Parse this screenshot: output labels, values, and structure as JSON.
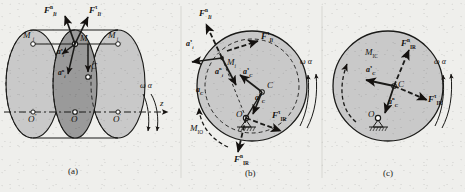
{
  "figure": {
    "caption_a": "(a)",
    "caption_b": "(b)",
    "caption_c": "(c)",
    "colors": {
      "light_gray": "#c9c9c9",
      "dark_gray": "#9a9a9a",
      "stroke": "#1a1a18",
      "page": "#efefec"
    }
  },
  "panel_a": {
    "points": {
      "m_i_double_prime": "M",
      "m_i_double_prime_sub": "i",
      "m_i_double_prime_sup": "″",
      "m_i": "M",
      "m_i_sub": "i",
      "m_i_prime": "M",
      "m_i_prime_sub": "i",
      "m_i_prime_sup": "′",
      "o_double_prime": "O",
      "o_double_prime_sup": "″",
      "o": "O",
      "o_prime": "O",
      "o_prime_sup": "′",
      "c": "C"
    },
    "vectors": {
      "f_in_base": "F",
      "f_in_sub": "Ii",
      "f_in_sup": "n",
      "f_it_base": "F",
      "f_it_sub": "Ii",
      "f_it_sup": "τ",
      "a_it_base": "a",
      "a_it_sub": "i",
      "a_it_sup": "τ",
      "a_in_base": "a",
      "a_in_sub": "i",
      "a_in_sup": "n"
    },
    "axis": {
      "z_label": "z",
      "omega": "ω",
      "alpha": "α"
    }
  },
  "panel_b": {
    "points": {
      "m_i": "M",
      "m_i_sub": "i",
      "c": "C",
      "o": "O"
    },
    "vectors": {
      "f_in_base": "F",
      "f_in_sub": "Ii",
      "f_in_sup": "n",
      "f_it_base": "F",
      "f_it_sub": "Ii",
      "f_it_sup": "τ",
      "a_it_base": "a",
      "a_it_sub": "i",
      "a_it_sup": "τ",
      "a_in_base": "a",
      "a_in_sub": "i",
      "a_in_sup": "n",
      "a_c_base": "a",
      "a_c_sub": "C",
      "a_ct_base": "a",
      "a_ct_sub": "C",
      "a_ct_sup": "τ",
      "a_cn_base": "a",
      "a_cn_sub": "C",
      "a_cn_sup": "n",
      "f_irt_base": "F",
      "f_irt_sub": "IR",
      "f_irt_sup": "τ",
      "f_irn_base": "F",
      "f_irn_sub": "IR",
      "f_irn_sup": "n",
      "m_io_base": "M",
      "m_io_sub": "IO"
    },
    "axis": {
      "omega": "ω",
      "alpha": "α"
    }
  },
  "panel_c": {
    "points": {
      "c": "C",
      "o": "O"
    },
    "vectors": {
      "m_ic_base": "M",
      "m_ic_sub": "IC",
      "f_irn_base": "F",
      "f_irn_sub": "IR",
      "f_irn_sup": "n",
      "f_irt_base": "F",
      "f_irt_sub": "IR",
      "f_irt_sup": "τ",
      "a_ct_base": "a",
      "a_ct_sub": "C",
      "a_ct_sup": "τ",
      "a_cn_base": "a",
      "a_cn_sub": "C",
      "a_cn_sup": "n"
    },
    "axis": {
      "omega": "ω",
      "alpha": "α"
    }
  }
}
